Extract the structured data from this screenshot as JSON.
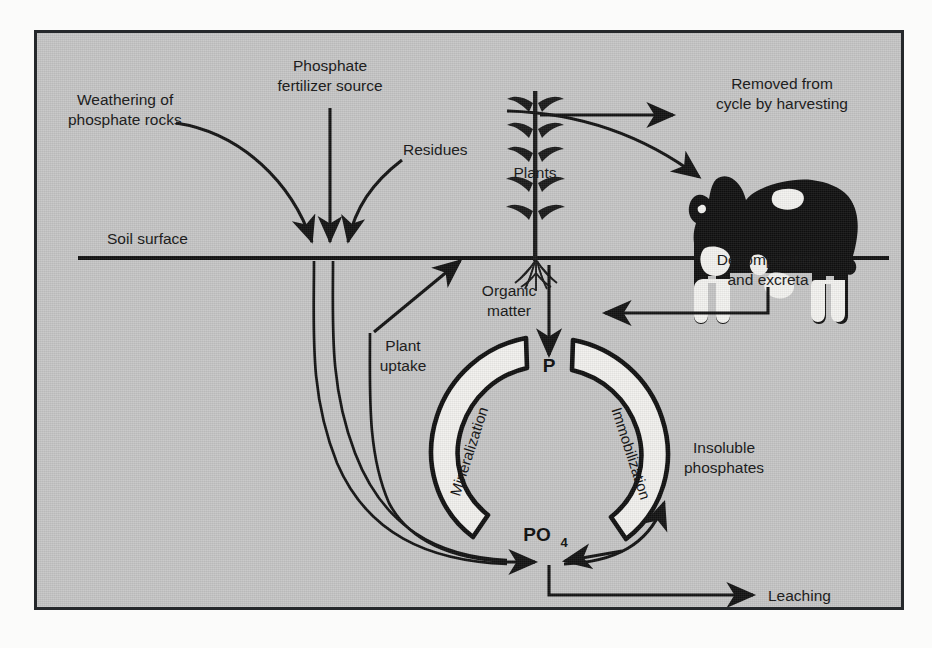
{
  "figure": {
    "title_semantic": "phosphorus-cycle-diagram",
    "background_color": "#c6c6c6",
    "frame_color": "#25282b",
    "ink_color": "#131313",
    "crescent_fill": "#f2f1ee"
  },
  "labels": {
    "weathering": "Weathering of\nphosphate rocks",
    "weathering_line1": "Weathering of",
    "weathering_line2": "phosphate rocks",
    "fertilizer_line1": "Phosphate",
    "fertilizer_line2": "fertilizer source",
    "residues": "Residues",
    "soil_surface": "Soil surface",
    "plants": "Plants",
    "harvest_line1": "Removed from",
    "harvest_line2": "cycle by harvesting",
    "decomposition_line1": "Decomposition",
    "decomposition_line2": "and excreta",
    "organic_matter_line1": "Organic",
    "organic_matter_line2": "matter",
    "plant_uptake_line1": "Plant",
    "plant_uptake_line2": "uptake",
    "mineralization": "Mineralization",
    "immobilization": "Immobilization",
    "insoluble_line1": "Insoluble",
    "insoluble_line2": "phosphates",
    "leaching": "Leaching",
    "pool_p": "P",
    "pool_po4_main": "PO",
    "pool_po4_sub": "4"
  },
  "elements": {
    "cow": "dairy-cow-silhouette",
    "plant": "corn-plant-silhouette",
    "mineralization_arc": "left-crescent-arc",
    "immobilization_arc": "right-crescent-arc"
  },
  "flows": [
    {
      "name": "weathering-to-soil",
      "from": "Weathering of phosphate rocks",
      "to": "soil surface"
    },
    {
      "name": "fertilizer-to-soil",
      "from": "Phosphate fertilizer source",
      "to": "soil surface"
    },
    {
      "name": "residues-to-soil",
      "from": "Residues",
      "to": "soil surface"
    },
    {
      "name": "plants-to-harvest",
      "from": "Plants",
      "to": "Removed from cycle by harvesting"
    },
    {
      "name": "plants-to-cow",
      "from": "Plants",
      "to": "cow"
    },
    {
      "name": "cow-to-organic-matter",
      "from": "Decomposition and excreta",
      "to": "Organic matter"
    },
    {
      "name": "organic-matter-to-p",
      "from": "Organic matter",
      "to": "P"
    },
    {
      "name": "plant-uptake-to-roots",
      "from": "PO4",
      "to": "Plants"
    },
    {
      "name": "soil-inputs-to-po4",
      "from": "soil surface inputs",
      "to": "PO4"
    },
    {
      "name": "po4-to-insoluble",
      "from": "PO4",
      "to": "Insoluble phosphates"
    },
    {
      "name": "po4-to-leaching",
      "from": "PO4",
      "to": "Leaching"
    }
  ]
}
